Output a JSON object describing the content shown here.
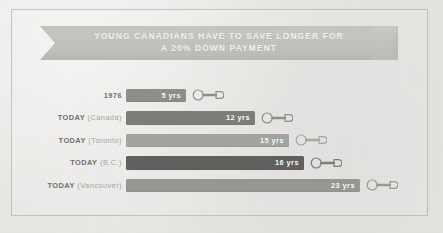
{
  "banner": {
    "line1": "YOUNG CANADIANS HAVE TO SAVE LONGER FOR",
    "line2": "A 20% DOWN PAYMENT"
  },
  "colors": {
    "background": "#e8e8e6",
    "banner": "#c2c2bf",
    "banner_text": "#f2f2f0",
    "label_strong": "#6e6e6b",
    "label_soft": "#a6a6a3",
    "bar_value_text": "#ffffff",
    "key_icon": "#8f8f8c"
  },
  "chart_data": {
    "type": "bar",
    "title": "YOUNG CANADIANS HAVE TO SAVE LONGER FOR A 20% DOWN PAYMENT",
    "xlabel": "",
    "ylabel": "",
    "orientation": "horizontal",
    "grid": false,
    "legend": false,
    "unit": "yrs",
    "xlim": [
      0,
      23
    ],
    "categories": [
      "1976",
      "TODAY (Canada)",
      "TODAY (Toronto)",
      "TODAY (B.C.)",
      "TODAY (Vancouver)"
    ],
    "values": [
      5,
      12,
      15,
      16,
      23
    ],
    "value_labels": [
      "5 yrs",
      "12 yrs",
      "15 yrs",
      "16 yrs",
      "23 yrs"
    ],
    "bar_colors": [
      "#8d8d8a",
      "#7c7c79",
      "#a3a3a0",
      "#5f5f5d",
      "#969693"
    ]
  },
  "rows": [
    {
      "label_strong": "1976",
      "label_soft": "",
      "value_label": "5 yrs",
      "value": 5,
      "bar_color": "#8d8d8a",
      "bar_width_px": 60,
      "icon": "key-icon"
    },
    {
      "label_strong": "TODAY",
      "label_soft": " (Canada)",
      "value_label": "12 yrs",
      "value": 12,
      "bar_color": "#7c7c79",
      "bar_width_px": 129,
      "icon": "key-icon"
    },
    {
      "label_strong": "TODAY",
      "label_soft": " (Toronto)",
      "value_label": "15 yrs",
      "value": 15,
      "bar_color": "#a3a3a0",
      "bar_width_px": 163,
      "icon": "key-icon"
    },
    {
      "label_strong": "TODAY",
      "label_soft": " (B.C.)",
      "value_label": "16 yrs",
      "value": 16,
      "bar_color": "#5f5f5d",
      "bar_width_px": 178,
      "icon": "key-icon"
    },
    {
      "label_strong": "TODAY",
      "label_soft": " (Vancouver)",
      "value_label": "23 yrs",
      "value": 23,
      "bar_color": "#969693",
      "bar_width_px": 234,
      "icon": "key-icon"
    }
  ]
}
